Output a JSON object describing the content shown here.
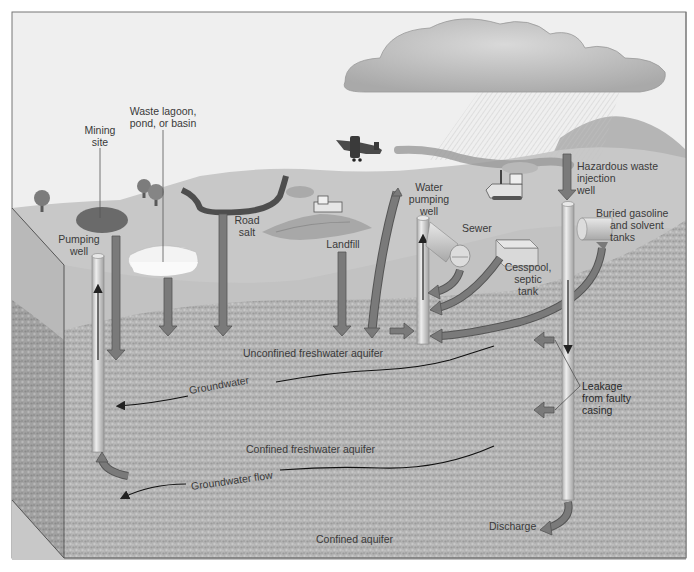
{
  "diagram": {
    "colors": {
      "sky": "#eeeeee",
      "land_surface": "#c9c9c9",
      "soil_upper": "#bdbdbd",
      "aquifer_texture": "#a9a9a9",
      "arrow_fill": "#7a7a7a",
      "arrow_stroke": "#555555",
      "well_fill": "#d6d6d6",
      "label_text": "#3a3a3a"
    },
    "labels": {
      "mining_site": [
        "Mining",
        "site"
      ],
      "waste_lagoon": [
        "Waste lagoon,",
        "pond, or basin"
      ],
      "pumping_well": [
        "Pumping",
        "well"
      ],
      "road_salt": [
        "Road",
        "salt"
      ],
      "landfill": "Landfill",
      "water_pumping_well": [
        "Water",
        "pumping",
        "well"
      ],
      "sewer": "Sewer",
      "cesspool": [
        "Cesspool,",
        "septic",
        "tank"
      ],
      "hazardous_waste": [
        "Hazardous waste",
        "injection",
        "well"
      ],
      "buried_tanks": [
        "Buried gasoline",
        "and solvent",
        "tanks"
      ],
      "unconfined_aquifer": "Unconfined freshwater aquifer",
      "groundwater": "Groundwater",
      "leakage": [
        "Leakage",
        "from faulty",
        "casing"
      ],
      "confined_freshwater_aquifer": "Confined freshwater aquifer",
      "groundwater_flow": "Groundwater flow",
      "discharge": "Discharge",
      "confined_aquifer": "Confined aquifer"
    }
  }
}
